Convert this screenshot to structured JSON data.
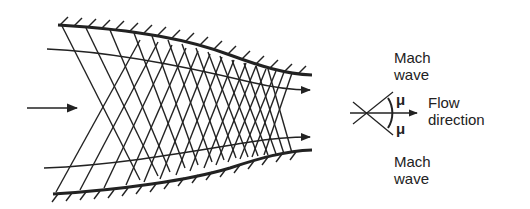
{
  "figure": {
    "colors": {
      "ink": "#222222",
      "background": "#ffffff"
    }
  },
  "labels": {
    "mach_wave_top_line1": "Mach",
    "mach_wave_top_line2": "wave",
    "mu_upper": "μ",
    "mu_lower": "μ",
    "flow_direction_line1": "Flow",
    "flow_direction_line2": "direction",
    "mach_wave_bottom_line1": "Mach",
    "mach_wave_bottom_line2": "wave"
  },
  "geometry": {
    "upper_wall": {
      "start": [
        58,
        25
      ],
      "end": [
        312,
        75
      ]
    },
    "lower_wall": {
      "start": [
        53,
        194
      ],
      "end": [
        312,
        150
      ]
    },
    "upper_streamline": {
      "start": [
        47,
        49
      ],
      "end": [
        312,
        90
      ]
    },
    "lower_streamline": {
      "start": [
        44,
        168
      ],
      "end": [
        312,
        137
      ]
    },
    "inflow_arrow": {
      "start": [
        27,
        108
      ],
      "end": [
        78,
        108
      ]
    },
    "schematic_center": [
      364,
      113
    ]
  }
}
